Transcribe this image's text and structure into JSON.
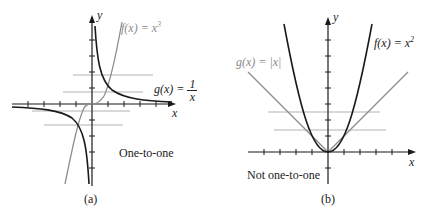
{
  "panels": [
    {
      "id": "a",
      "caption": "(a)",
      "verdict": "One-to-one",
      "axes": {
        "x_label": "x",
        "y_label": "y"
      },
      "curves": [
        {
          "name": "f",
          "label_lhs": "f(x) = x",
          "label_exp": "3",
          "color": "#8c8c8c",
          "expression": "x^3"
        },
        {
          "name": "g",
          "label_lhs": "g(x) =",
          "label_num": "1",
          "label_den": "x",
          "color": "#1a1a1a",
          "expression": "1/x"
        }
      ],
      "horizontal_test_lines": 4
    },
    {
      "id": "b",
      "caption": "(b)",
      "verdict": "Not one-to-one",
      "axes": {
        "x_label": "x",
        "y_label": "y"
      },
      "curves": [
        {
          "name": "f",
          "label_lhs": "f(x) = x",
          "label_exp": "2",
          "color": "#1a1a1a",
          "expression": "x^2"
        },
        {
          "name": "g",
          "label": "g(x) = |x|",
          "color": "#8c8c8c",
          "expression": "|x|"
        }
      ],
      "horizontal_test_lines": 2
    }
  ],
  "colors": {
    "axis": "#1a1a1a",
    "dark_curve": "#1a1a1a",
    "light_curve": "#8c8c8c",
    "test_line": "#b0b0b0"
  }
}
